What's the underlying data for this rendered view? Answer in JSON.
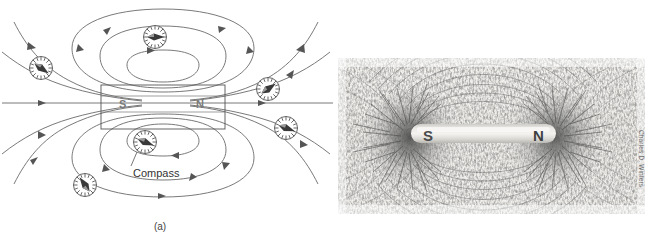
{
  "figure": {
    "background_color": "#ffffff"
  },
  "panel_a": {
    "caption": "(a)",
    "type": "line-diagram",
    "description": "Line drawing of a bar magnet with magnetic field lines and compasses",
    "magnet": {
      "left_pole_label": "S",
      "right_pole_label": "N",
      "outline_color": "#555555",
      "label_color": "#6b6b6b"
    },
    "annotation": {
      "label": "Compass",
      "color": "#333333"
    },
    "field_line_color": "#666666",
    "compass_count": 7,
    "compasses": [
      {
        "id": "compass-top",
        "x": 155,
        "y": 37,
        "r": 12,
        "needle_angle": 0
      },
      {
        "id": "compass-upper-left",
        "x": 41,
        "y": 68,
        "r": 12,
        "needle_angle": 145
      },
      {
        "id": "compass-upper-right",
        "x": 268,
        "y": 89,
        "r": 12,
        "needle_angle": 35
      },
      {
        "id": "compass-lower-right",
        "x": 286,
        "y": 128,
        "r": 12,
        "needle_angle": 20
      },
      {
        "id": "compass-center-bottom",
        "x": 145,
        "y": 142,
        "r": 12,
        "needle_angle": 20
      },
      {
        "id": "compass-lower-left",
        "x": 85,
        "y": 185,
        "r": 12,
        "needle_angle": 60
      }
    ]
  },
  "panel_b": {
    "caption": "(b)",
    "type": "photograph",
    "description": "Photograph of iron filings revealing the magnetic field around a bar magnet",
    "magnet": {
      "left_pole_label": "S",
      "right_pole_label": "N",
      "bar_color": "#d8d6d2",
      "label_color": "#4a4a4a"
    },
    "photo_credit": "Charles D. Winters",
    "photo_background": "#f2f1ee"
  }
}
